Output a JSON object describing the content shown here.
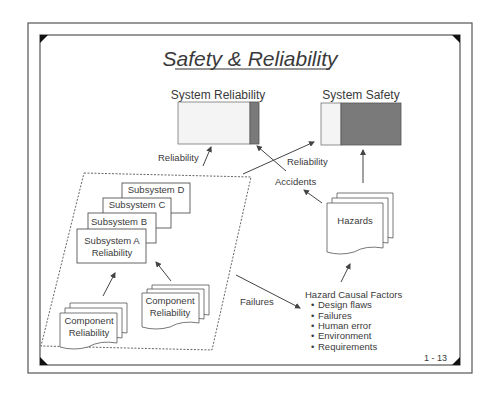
{
  "slide": {
    "title": "Safety & Reliability",
    "page_number": "1 - 13"
  },
  "bars": {
    "reliability": {
      "label": "System Reliability",
      "light_color": "#f4f4f4",
      "dark_color": "#7a7a7a"
    },
    "safety": {
      "label": "System Safety",
      "light_color": "#f4f4f4",
      "dark_color": "#7a7a7a"
    }
  },
  "subsystems": {
    "d": "Subsystem D",
    "c": "Subsystem C",
    "b": "Subsystem B",
    "a_line1": "Subsystem A",
    "a_line2": "Reliability"
  },
  "components": {
    "left_line1": "Component",
    "left_line2": "Reliability",
    "right_line1": "Component",
    "right_line2": "Reliability"
  },
  "labels": {
    "reliability_left": "Reliability",
    "reliability_right": "Reliability",
    "accidents": "Accidents",
    "failures": "Failures",
    "hazards": "Hazards"
  },
  "hazard_factors": {
    "title": "Hazard Causal Factors",
    "items": [
      "Design flaws",
      "Failures",
      "Human error",
      "Environment",
      "Requirements"
    ]
  }
}
